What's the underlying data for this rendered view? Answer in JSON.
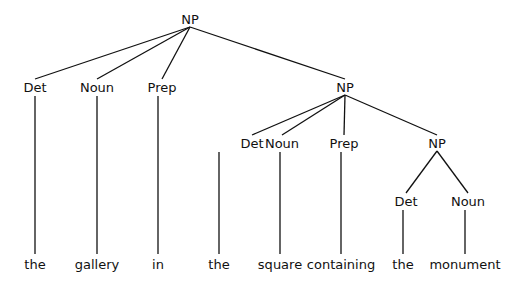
{
  "tree": {
    "label": "NP",
    "children": [
      {
        "label": "Det",
        "children": [
          {
            "label": "the"
          }
        ]
      },
      {
        "label": "Noun",
        "children": [
          {
            "label": "gallery"
          }
        ]
      },
      {
        "label": "Prep",
        "children": [
          {
            "label": "in"
          }
        ]
      },
      {
        "label": "NP",
        "children": [
          {
            "label": "Det",
            "children": [
              {
                "label": "the"
              }
            ]
          },
          {
            "label": "Noun",
            "children": [
              {
                "label": "square"
              }
            ]
          },
          {
            "label": "Prep",
            "children": [
              {
                "label": "containing"
              }
            ]
          },
          {
            "label": "NP",
            "children": [
              {
                "label": "Det",
                "children": [
                  {
                    "label": "the"
                  }
                ]
              },
              {
                "label": "Noun",
                "children": [
                  {
                    "label": "monument"
                  }
                ]
              }
            ]
          }
        ]
      }
    ]
  }
}
